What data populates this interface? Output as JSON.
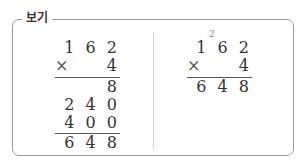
{
  "label": "보기",
  "left_calc": {
    "multiplicand": "1 6 2",
    "operator": "×",
    "multiplier": "4",
    "partials": [
      "8",
      "2 4 0",
      "4 0 0"
    ],
    "result": "6 4 8"
  },
  "right_calc": {
    "carry": "2",
    "multiplicand": "1 6 2",
    "operator": "×",
    "multiplier": "4",
    "result": "6 4 8"
  }
}
